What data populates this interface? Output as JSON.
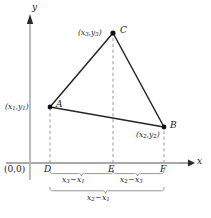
{
  "figure": {
    "type": "geometry-diagram",
    "background_color": "#ffffff",
    "line_color": "#1a1a1a",
    "dashed_color": "#999999",
    "axis_color": "#808080",
    "width": 211,
    "height": 218
  },
  "axes": {
    "x_label": "x",
    "y_label": "y",
    "origin_label": "(0,0)"
  },
  "vertices": [
    {
      "id": "A",
      "point_label": "A",
      "coord_label": "(x₁,y₁)",
      "coord_x_sub": "1",
      "coord_y_sub": "1",
      "px": 50,
      "py": 107
    },
    {
      "id": "B",
      "point_label": "B",
      "coord_label": "(x₂,y₂)",
      "coord_x_sub": "2",
      "coord_y_sub": "2",
      "px": 164,
      "py": 127
    },
    {
      "id": "C",
      "point_label": "C",
      "coord_label": "(x₃,y₃)",
      "coord_x_sub": "3",
      "coord_y_sub": "3",
      "px": 113,
      "py": 33
    }
  ],
  "foot_points": [
    {
      "id": "D",
      "label": "D",
      "px": 50
    },
    {
      "id": "E",
      "label": "E",
      "px": 113
    },
    {
      "id": "F",
      "label": "F",
      "px": 164
    }
  ],
  "braces": [
    {
      "id": "brace-DE",
      "label": "x₃ − x₁",
      "minuend_sub": "3",
      "subtrahend_sub": "1",
      "from": "D",
      "to": "E"
    },
    {
      "id": "brace-EF",
      "label": "x₂ − x₃",
      "minuend_sub": "2",
      "subtrahend_sub": "3",
      "from": "E",
      "to": "F"
    },
    {
      "id": "brace-DF",
      "label": "x₂ − x₁",
      "minuend_sub": "2",
      "subtrahend_sub": "1",
      "from": "D",
      "to": "F"
    }
  ]
}
